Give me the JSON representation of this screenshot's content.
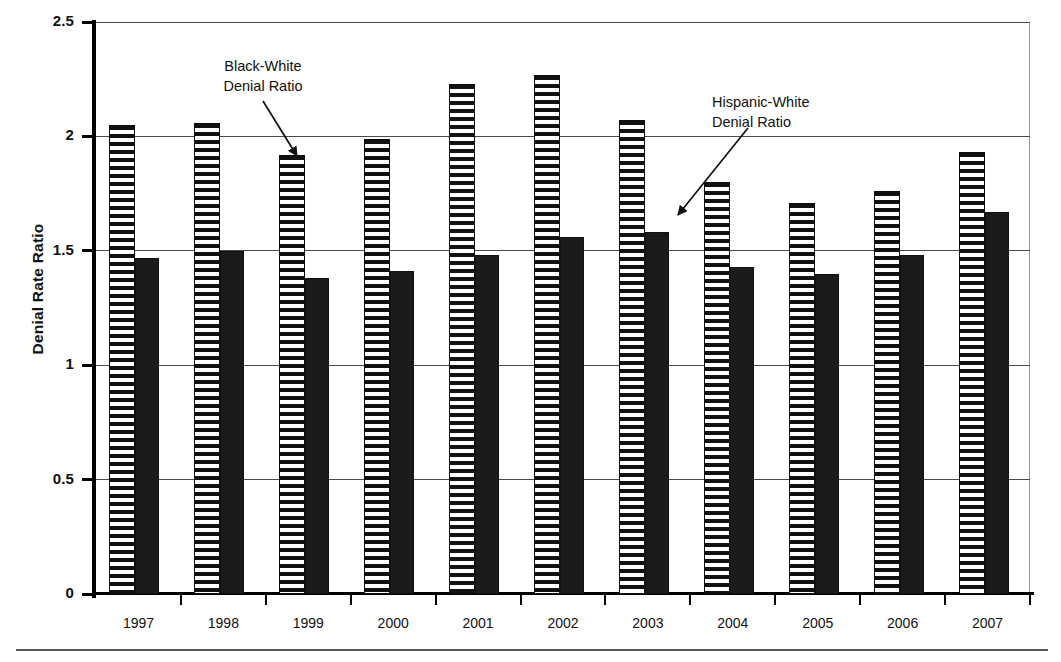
{
  "chart_data": {
    "type": "bar",
    "title": "",
    "subtitle": "",
    "xlabel": "",
    "ylabel": "Denial Rate Ratio",
    "categories": [
      "1997",
      "1998",
      "1999",
      "2000",
      "2001",
      "2002",
      "2003",
      "2004",
      "2005",
      "2006",
      "2007"
    ],
    "series": [
      {
        "name": "Black-White Denial Ratio",
        "style": "horizontal-hatched",
        "values": [
          2.05,
          2.06,
          1.92,
          1.99,
          2.23,
          2.27,
          2.07,
          1.8,
          1.71,
          1.76,
          1.93
        ]
      },
      {
        "name": "Hispanic-White Denial Ratio",
        "style": "solid-black",
        "values": [
          1.47,
          1.5,
          1.38,
          1.41,
          1.48,
          1.56,
          1.58,
          1.43,
          1.4,
          1.48,
          1.67
        ]
      }
    ],
    "ylim": [
      0,
      2.5
    ],
    "ytick_labels": [
      "0",
      "0.5",
      "1",
      "1.5",
      "2",
      "2.5"
    ],
    "ytick_values": [
      0,
      0.5,
      1,
      1.5,
      2,
      2.5
    ],
    "grid": "horizontal",
    "legend_position": "none",
    "annotations": [
      {
        "id": "black-white",
        "text": "Black-White\nDenial Ratio",
        "points_to_category": "1999",
        "points_to_series": "Black-White Denial Ratio"
      },
      {
        "id": "hispanic-white",
        "text": "Hispanic-White\nDenial Ratio",
        "points_to_category": "2003",
        "points_to_series": "Hispanic-White Denial Ratio"
      }
    ]
  },
  "axis": {
    "y_title": "Denial Rate Ratio"
  },
  "annotations": {
    "black_white": "Black-White\nDenial Ratio",
    "hispanic_white": "Hispanic-White\nDenial Ratio"
  },
  "colors": {
    "bar_solid": "#1b1b1b",
    "bar_hatch_line": "#111111",
    "bar_hatch_bg": "#ffffff",
    "gridline": "#4a4a4a",
    "axis": "#000000",
    "plot_border": "#9a9a9a",
    "text": "#111111"
  }
}
